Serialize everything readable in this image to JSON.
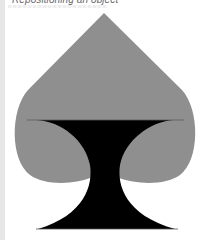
{
  "header": {
    "title": "Repositioning an object"
  },
  "figure": {
    "colors": {
      "spade_top": "#8f8f8f",
      "stem": "#000000",
      "background": "#ffffff",
      "left_bar": "#e6e6e6"
    }
  }
}
